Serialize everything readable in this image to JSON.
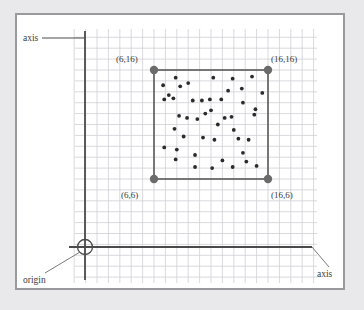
{
  "figure": {
    "title": "",
    "background_color": "#e9e9ec",
    "panel_color": "#ffffff",
    "frame_color": "#9a9a9e",
    "grid_color": "#cfcfd6",
    "axis_color": "#4a4a4a",
    "square_color": "#5a5a5a",
    "point_color": "#2b2b2b",
    "corner_dot_color": "#6b6b6b"
  },
  "labels": {
    "axis_vertical": "axis",
    "axis_horizontal": "axis",
    "origin": "origin",
    "corner_top_left": "(6,16)",
    "corner_top_right": "(16,16)",
    "corner_bottom_left": "(6,6)",
    "corner_bottom_right": "(16,6)"
  },
  "chart_data": {
    "type": "scatter",
    "title": "",
    "xlabel": "axis",
    "ylabel": "axis",
    "grid": true,
    "legend": null,
    "xlim": [
      0,
      20
    ],
    "ylim": [
      0,
      20
    ],
    "grid_step": 1,
    "origin": [
      0,
      0
    ],
    "bounding_square": {
      "corners": [
        [
          6,
          6
        ],
        [
          16,
          6
        ],
        [
          16,
          16
        ],
        [
          6,
          16
        ]
      ],
      "labels": [
        "(6,6)",
        "(16,6)",
        "(16,16)",
        "(6,16)"
      ],
      "x_range": [
        6,
        16
      ],
      "y_range": [
        6,
        16
      ]
    },
    "points": [
      [
        6.8,
        14.6
      ],
      [
        7.9,
        15.3
      ],
      [
        9.0,
        14.8
      ],
      [
        11.2,
        15.3
      ],
      [
        12.9,
        15.2
      ],
      [
        14.6,
        15.4
      ],
      [
        8.3,
        14.5
      ],
      [
        7.3,
        13.7
      ],
      [
        12.5,
        14.1
      ],
      [
        13.7,
        14.3
      ],
      [
        15.5,
        13.9
      ],
      [
        6.9,
        13.3
      ],
      [
        7.7,
        13.4
      ],
      [
        10.2,
        13.2
      ],
      [
        10.9,
        13.3
      ],
      [
        11.9,
        13.3
      ],
      [
        9.4,
        13.2
      ],
      [
        13.8,
        13.0
      ],
      [
        14.9,
        12.4
      ],
      [
        11.0,
        12.3
      ],
      [
        8.2,
        11.8
      ],
      [
        8.9,
        11.6
      ],
      [
        9.8,
        11.5
      ],
      [
        12.2,
        11.6
      ],
      [
        12.8,
        11.7
      ],
      [
        14.8,
        11.9
      ],
      [
        11.6,
        11.0
      ],
      [
        7.8,
        10.6
      ],
      [
        13.0,
        10.5
      ],
      [
        8.6,
        9.9
      ],
      [
        10.3,
        9.8
      ],
      [
        11.3,
        9.6
      ],
      [
        13.4,
        9.7
      ],
      [
        14.3,
        9.6
      ],
      [
        6.9,
        8.9
      ],
      [
        8.0,
        8.7
      ],
      [
        9.6,
        8.2
      ],
      [
        13.8,
        8.4
      ],
      [
        7.9,
        7.8
      ],
      [
        12.0,
        7.7
      ],
      [
        14.1,
        7.6
      ],
      [
        9.6,
        7.1
      ],
      [
        11.1,
        7.0
      ],
      [
        12.9,
        7.1
      ],
      [
        15.0,
        7.2
      ],
      [
        10.5,
        12.0
      ]
    ]
  }
}
